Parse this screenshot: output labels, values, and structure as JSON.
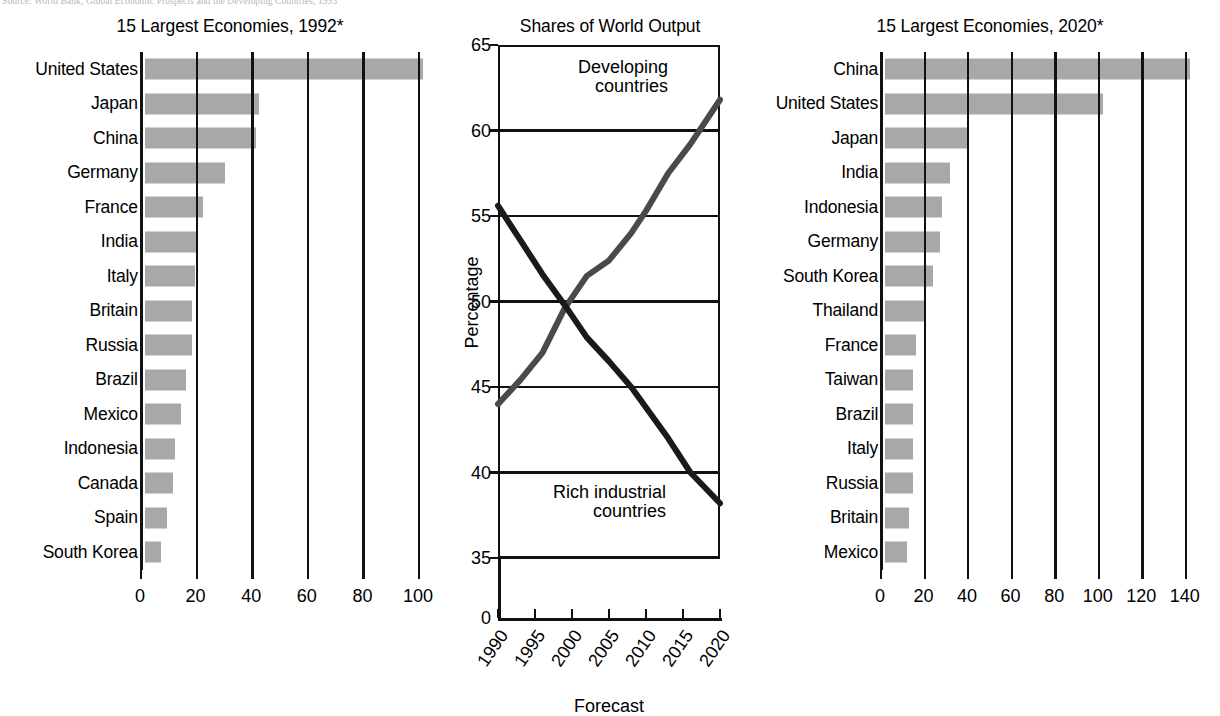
{
  "source": {
    "text": "Source: World Bank, Global Economic Prospects and the Developing Countries, 1993"
  },
  "panels": {
    "left": {
      "title": "15 Largest Economies, 1992*",
      "xticks": [
        "0",
        "20",
        "40",
        "60",
        "80",
        "100"
      ]
    },
    "middle": {
      "title": "Shares of World Output",
      "ylabel": "Percentage",
      "xlabel": "Forecast",
      "yticks": [
        "0",
        "35",
        "40",
        "45",
        "50",
        "55",
        "60",
        "65"
      ],
      "xticks": [
        "1990",
        "1995",
        "2000",
        "2005",
        "2010",
        "2015",
        "2020"
      ],
      "annot_developing_line1": "Developing",
      "annot_developing_line2": "countries",
      "annot_rich_line1": "Rich industrial",
      "annot_rich_line2": "countries"
    },
    "right": {
      "title": "15 Largest Economies, 2020*",
      "xticks": [
        "0",
        "20",
        "40",
        "60",
        "80",
        "100",
        "120",
        "140"
      ]
    }
  },
  "colors": {
    "bar_fill": "#a8a8a8",
    "axis": "#111111",
    "line_developing": "#4a4a4a",
    "line_rich": "#1a1a1a",
    "background": "#ffffff"
  },
  "chart_data": [
    {
      "type": "bar",
      "title": "15 Largest Economies, 1992*",
      "orientation": "horizontal",
      "xlabel": "",
      "ylabel": "",
      "xlim": [
        0,
        105
      ],
      "xticks": [
        0,
        20,
        40,
        60,
        80,
        100
      ],
      "grid": true,
      "categories": [
        "United States",
        "Japan",
        "China",
        "Germany",
        "France",
        "India",
        "Italy",
        "Britain",
        "Russia",
        "Brazil",
        "Mexico",
        "Indonesia",
        "Canada",
        "Spain",
        "South Korea"
      ],
      "values": [
        100,
        41,
        40,
        29,
        21,
        19,
        18,
        17,
        17,
        15,
        13,
        11,
        10,
        8,
        6
      ]
    },
    {
      "type": "line",
      "title": "Shares of World Output",
      "xlabel": "Forecast",
      "ylabel": "Percentage",
      "ylim": [
        33,
        65
      ],
      "yticks": [
        0,
        35,
        40,
        45,
        50,
        55,
        60,
        65
      ],
      "xticks": [
        1990,
        1995,
        2000,
        2005,
        2010,
        2015,
        2020
      ],
      "xlim": [
        1990,
        2020
      ],
      "grid": true,
      "legend": "inline-annotations",
      "series": [
        {
          "name": "Developing countries",
          "x": [
            1990,
            1993,
            1996,
            1999,
            2002,
            2005,
            2008,
            2010,
            2013,
            2016,
            2020
          ],
          "values": [
            44.0,
            45.4,
            47.0,
            49.6,
            51.5,
            52.4,
            54.0,
            55.3,
            57.5,
            59.2,
            61.8
          ]
        },
        {
          "name": "Rich industrial countries",
          "x": [
            1990,
            1993,
            1996,
            1999,
            2002,
            2005,
            2008,
            2010,
            2013,
            2016,
            2020
          ],
          "values": [
            55.6,
            53.6,
            51.6,
            49.8,
            47.9,
            46.5,
            45.0,
            43.8,
            42.0,
            40.0,
            38.2
          ]
        }
      ]
    },
    {
      "type": "bar",
      "title": "15 Largest Economies, 2020*",
      "orientation": "horizontal",
      "xlabel": "",
      "ylabel": "",
      "xlim": [
        0,
        147
      ],
      "xticks": [
        0,
        20,
        40,
        60,
        80,
        100,
        120,
        140
      ],
      "grid": true,
      "categories": [
        "China",
        "United States",
        "Japan",
        "India",
        "Indonesia",
        "Germany",
        "South Korea",
        "Thailand",
        "France",
        "Taiwan",
        "Brazil",
        "Italy",
        "Russia",
        "Britain",
        "Mexico"
      ],
      "values": [
        140,
        100,
        38,
        30,
        26,
        25,
        22,
        18,
        14,
        13,
        13,
        13,
        13,
        11,
        10
      ]
    }
  ]
}
